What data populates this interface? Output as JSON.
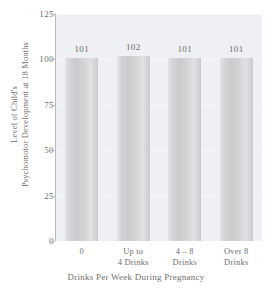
{
  "chart_data": {
    "type": "bar",
    "title": "",
    "categories": [
      "0",
      "Up to 4 Drinks",
      "4 – 8 Drinks",
      "Over 8 Drinks"
    ],
    "category_lines": [
      [
        "0"
      ],
      [
        "Up to",
        "4 Drinks"
      ],
      [
        "4 – 8",
        "Drinks"
      ],
      [
        "Over 8",
        "Drinks"
      ]
    ],
    "values": [
      101,
      102,
      101,
      101
    ],
    "value_labels": [
      "101",
      "102",
      "101",
      "101"
    ],
    "xlabel": "Drinks Per Week During Pregnancy",
    "ylabel": "Level of Child's Psychomotor Development at 18 Months",
    "ylabel_lines": [
      "Level of Child's",
      "Psychomotor Development at 18 Months"
    ],
    "ylim": [
      0,
      125
    ],
    "yticks": [
      0,
      25,
      50,
      75,
      100,
      125
    ],
    "ytick_labels": [
      "0",
      "25",
      "50",
      "75",
      "100",
      "125"
    ],
    "grid": true,
    "grid_axis": "y",
    "legend": null,
    "colors": {
      "panel_background": "#eef0f3",
      "bar_fill": "#d2d4d6",
      "gridline": "#ffffff",
      "axis": "#b9bbbd",
      "text": "#6f6f6f"
    }
  }
}
